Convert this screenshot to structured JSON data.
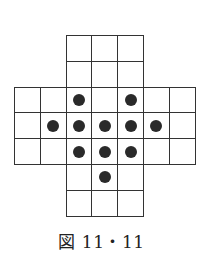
{
  "diagram": {
    "type": "peg-solitaire-board",
    "grid_size": 7,
    "cell_px": 25.8,
    "origin": [
      14,
      35
    ],
    "line_color": "#333333",
    "peg_color": "#2a2a2a",
    "valid_cells": [
      [
        0,
        2
      ],
      [
        0,
        3
      ],
      [
        0,
        4
      ],
      [
        1,
        2
      ],
      [
        1,
        3
      ],
      [
        1,
        4
      ],
      [
        2,
        0
      ],
      [
        2,
        1
      ],
      [
        2,
        2
      ],
      [
        2,
        3
      ],
      [
        2,
        4
      ],
      [
        2,
        5
      ],
      [
        2,
        6
      ],
      [
        3,
        0
      ],
      [
        3,
        1
      ],
      [
        3,
        2
      ],
      [
        3,
        3
      ],
      [
        3,
        4
      ],
      [
        3,
        5
      ],
      [
        3,
        6
      ],
      [
        4,
        0
      ],
      [
        4,
        1
      ],
      [
        4,
        2
      ],
      [
        4,
        3
      ],
      [
        4,
        4
      ],
      [
        4,
        5
      ],
      [
        4,
        6
      ],
      [
        5,
        2
      ],
      [
        5,
        3
      ],
      [
        5,
        4
      ],
      [
        6,
        2
      ],
      [
        6,
        3
      ],
      [
        6,
        4
      ]
    ],
    "pegs": [
      [
        2,
        2
      ],
      [
        2,
        4
      ],
      [
        3,
        1
      ],
      [
        3,
        2
      ],
      [
        3,
        3
      ],
      [
        3,
        4
      ],
      [
        3,
        5
      ],
      [
        4,
        2
      ],
      [
        4,
        3
      ],
      [
        4,
        4
      ],
      [
        5,
        3
      ]
    ]
  },
  "caption": "図 11・11"
}
